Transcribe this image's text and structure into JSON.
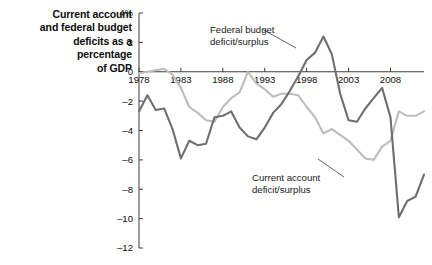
{
  "figure": {
    "caption": "Current account\nand federal budget\ndeficits as a\npercentage\nof GDP",
    "caption_lines": [
      "Current account",
      "and federal budget",
      "deficits as a",
      "percentage",
      "of GDP"
    ],
    "background_color": "#ffffff"
  },
  "annotations": {
    "federal_budget": {
      "line1": "Federal budget",
      "line2": "deficit/surplus",
      "text": "Federal budget\ndeficit/surplus"
    },
    "current_account": {
      "line1": "Current account",
      "line2": "deficit/surplus",
      "text": "Current account\ndeficit/surplus"
    }
  },
  "axes": {
    "y_unit_label": "4%",
    "y_tick_labels": [
      "4%",
      "2",
      "0",
      "–2",
      "–4",
      "–6",
      "–8",
      "–10",
      "–12"
    ],
    "y_tick_values": [
      4,
      2,
      0,
      -2,
      -4,
      -6,
      -8,
      -10,
      -12
    ],
    "x_tick_labels": [
      "1978",
      "1983",
      "1988",
      "1993",
      "1998",
      "2003",
      "2008"
    ],
    "x_tick_values": [
      1978,
      1983,
      1988,
      1993,
      1998,
      2003,
      2008
    ],
    "zero_line_label": "0"
  },
  "chart_data": {
    "type": "line",
    "xlabel": "",
    "ylabel": "Percentage of GDP",
    "xlim": [
      1978,
      2012
    ],
    "ylim": [
      -12,
      4
    ],
    "grid": false,
    "legend": "inline-annotations",
    "x": [
      1978,
      1979,
      1980,
      1981,
      1982,
      1983,
      1984,
      1985,
      1986,
      1987,
      1988,
      1989,
      1990,
      1991,
      1992,
      1993,
      1994,
      1995,
      1996,
      1997,
      1998,
      1999,
      2000,
      2001,
      2002,
      2003,
      2004,
      2005,
      2006,
      2007,
      2008,
      2009,
      2010,
      2011,
      2012
    ],
    "series": [
      {
        "name": "Federal budget deficit/surplus",
        "color": "#6e6e6e",
        "annotation": "Federal budget\ndeficit/surplus",
        "values": [
          -2.7,
          -1.6,
          -2.6,
          -2.5,
          -3.9,
          -5.9,
          -4.7,
          -5.0,
          -4.9,
          -3.1,
          -3.0,
          -2.7,
          -3.8,
          -4.4,
          -4.6,
          -3.8,
          -2.8,
          -2.2,
          -1.3,
          -0.3,
          0.8,
          1.3,
          2.4,
          1.2,
          -1.5,
          -3.3,
          -3.4,
          -2.5,
          -1.8,
          -1.1,
          -3.1,
          -9.9,
          -8.8,
          -8.5,
          -7.0
        ]
      },
      {
        "name": "Current account deficit/surplus",
        "color": "#bdbdbd",
        "annotation": "Current account\ndeficit/surplus",
        "values": [
          -0.1,
          0.0,
          0.1,
          0.2,
          -0.2,
          -1.1,
          -2.4,
          -2.8,
          -3.3,
          -3.4,
          -2.4,
          -1.8,
          -1.4,
          0.0,
          -0.8,
          -1.2,
          -1.7,
          -1.5,
          -1.5,
          -1.6,
          -2.4,
          -3.1,
          -4.2,
          -3.9,
          -4.3,
          -4.7,
          -5.3,
          -5.9,
          -6.0,
          -5.1,
          -4.7,
          -2.7,
          -3.0,
          -3.0,
          -2.7
        ]
      }
    ]
  },
  "colors": {
    "dark_series": "#6e6e6e",
    "light_series": "#bdbdbd",
    "axis": "#3c3c3c",
    "text": "#0d0d0d"
  }
}
